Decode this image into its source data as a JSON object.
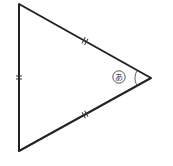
{
  "diagram": {
    "type": "triangle",
    "vertices": {
      "top": [
        19,
        4
      ],
      "bottom": [
        19,
        151
      ],
      "right": [
        151,
        78
      ]
    },
    "sides": [
      {
        "name": "left-side",
        "tick_marks": 2
      },
      {
        "name": "upper-right-side",
        "tick_marks": 2
      },
      {
        "name": "lower-right-side",
        "tick_marks": 2
      }
    ],
    "angle_label": {
      "vertex": "right",
      "text": "あ",
      "style": "circled"
    },
    "colors": {
      "line": "#222222",
      "background": "#ffffff"
    }
  }
}
